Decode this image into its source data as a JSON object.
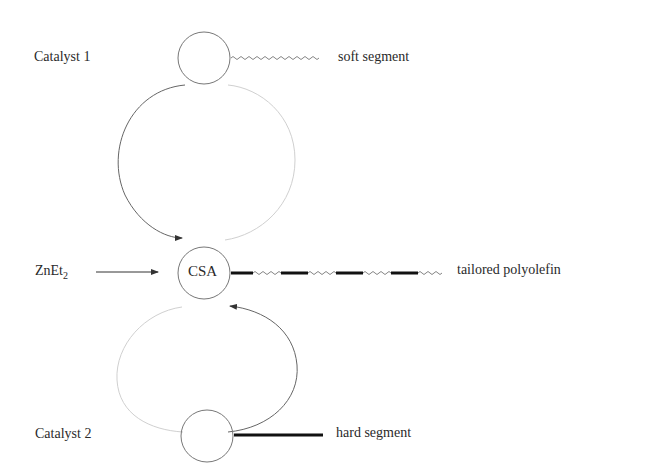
{
  "diagram": {
    "nodes": {
      "catalyst1": {
        "label": "Catalyst 1",
        "product": "soft segment"
      },
      "csa": {
        "label": "CSA",
        "product": "tailored polyolefin"
      },
      "catalyst2": {
        "label": "Catalyst 2",
        "product": "hard segment"
      }
    },
    "reagent": {
      "base": "ZnEt",
      "subscript": "2"
    },
    "colors": {
      "line": "#555555",
      "faded": "#cccccc",
      "hard": "#111111"
    }
  }
}
